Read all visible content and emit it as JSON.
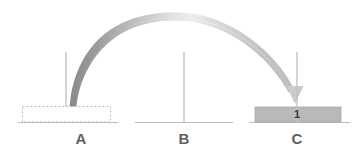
{
  "diagram": {
    "background_color": "#ffffff",
    "pegs": [
      {
        "id": "A",
        "label": "A",
        "label_x": 81,
        "label_y": 136,
        "post_x": 66,
        "post_top_y": 52,
        "post_bottom_y": 122,
        "base_x1": 18,
        "base_x2": 118,
        "base_y": 122,
        "state": "empty",
        "ghost_disk": {
          "visible": true,
          "style": "dashed-outline",
          "x": 22,
          "y": 106,
          "width": 88,
          "height": 16,
          "border_color": "#b9b9b9",
          "fill_color": "#ffffff"
        }
      },
      {
        "id": "B",
        "label": "B",
        "label_x": 164,
        "label_y": 136,
        "post_x": 184,
        "post_top_y": 52,
        "post_bottom_y": 122,
        "base_x1": 135,
        "base_x2": 233,
        "base_y": 122,
        "state": "empty",
        "ghost_disk": {
          "visible": false
        }
      },
      {
        "id": "C",
        "label": "C",
        "label_x": 277,
        "label_y": 136,
        "post_x": 297,
        "post_top_y": 52,
        "post_bottom_y": 122,
        "base_x1": 249,
        "base_x2": 350,
        "base_y": 122,
        "state": "occupied",
        "disk": {
          "number": "1",
          "x": 255,
          "y": 107,
          "width": 86,
          "height": 15,
          "fill_color": "#b7b7b7",
          "edge_color": "#9a9a9a",
          "label_x": 287,
          "label_y": 110
        },
        "ghost_disk": {
          "visible": false
        }
      }
    ],
    "move_arrow": {
      "from_peg": "A",
      "to_peg": "C",
      "description": "arc from peg A up and over to peg C",
      "start_x": 72,
      "start_y": 115,
      "apex_x": 181,
      "apex_y": 13,
      "end_x": 295,
      "end_y": 92,
      "stroke_color_start": "#8c8c8c",
      "stroke_color_mid": "#e9e9e9",
      "stroke_color_end": "#c9c9c9",
      "arrowhead_color": "#cfcfcf",
      "arrowhead_x": 295,
      "arrowhead_y": 104
    },
    "peg_post_color": "#c2c2c2",
    "peg_base_color": "#bfbfbf"
  }
}
